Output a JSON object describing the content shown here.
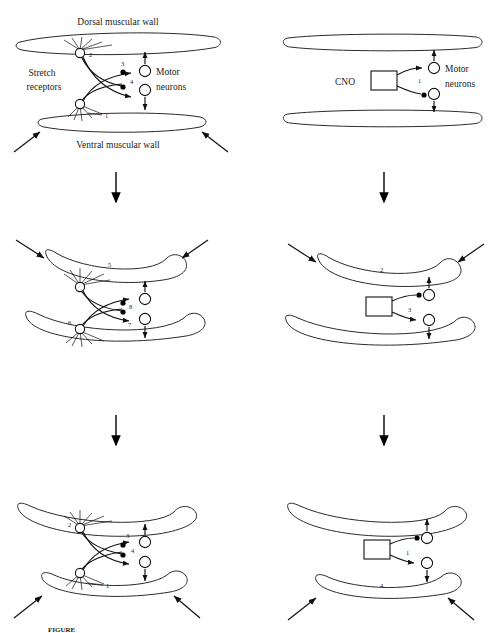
{
  "figure": {
    "caption": "FIGURE",
    "columns": [
      {
        "name": "control",
        "label": ""
      },
      {
        "name": "cno",
        "label": ""
      }
    ],
    "text_labels": {
      "dorsal_wall": "Dorsal muscular wall",
      "ventral_wall": "Ventral muscular wall",
      "stretch_receptors_line1": "Stretch",
      "stretch_receptors_line2": "receptors",
      "motor_neurons_line1": "Motor",
      "motor_neurons_line2": "neurons",
      "cno": "CNO"
    },
    "panels": [
      {
        "id": "top-left",
        "row": 1,
        "column": "control",
        "numbers": [
          "2",
          "3",
          "4",
          "1"
        ],
        "has_stretch_receptors": true,
        "has_cno_box": false,
        "wall_state": "straight",
        "external_arrows": 2
      },
      {
        "id": "top-right",
        "row": 1,
        "column": "cno",
        "numbers": [
          "1"
        ],
        "has_stretch_receptors": false,
        "has_cno_box": true,
        "wall_state": "straight",
        "external_arrows": 0
      },
      {
        "id": "middle-left",
        "row": 2,
        "column": "control",
        "numbers": [
          "5",
          "8",
          "6",
          "7"
        ],
        "has_stretch_receptors": true,
        "has_cno_box": false,
        "wall_state": "bent",
        "external_arrows": 2
      },
      {
        "id": "middle-right",
        "row": 2,
        "column": "cno",
        "numbers": [
          "2",
          "3"
        ],
        "has_stretch_receptors": false,
        "has_cno_box": true,
        "wall_state": "bent",
        "external_arrows": 2
      },
      {
        "id": "bottom-left",
        "row": 3,
        "column": "control",
        "numbers": [
          "2",
          "3",
          "4",
          "1"
        ],
        "has_stretch_receptors": true,
        "has_cno_box": false,
        "wall_state": "bent-down",
        "external_arrows": 2
      },
      {
        "id": "bottom-right",
        "row": 3,
        "column": "cno",
        "numbers": [
          "1",
          "4"
        ],
        "has_stretch_receptors": false,
        "has_cno_box": true,
        "wall_state": "bent-down",
        "external_arrows": 2
      }
    ],
    "flow_arrows": [
      {
        "name": "left-column-step-1-to-2",
        "direction": "down"
      },
      {
        "name": "right-column-step-1-to-2",
        "direction": "down"
      },
      {
        "name": "left-column-step-2-to-3",
        "direction": "down"
      },
      {
        "name": "right-column-step-2-to-3",
        "direction": "down"
      }
    ],
    "colors": {
      "ink": "#1a1a1a",
      "stroke": "#111111",
      "background": "#ffffff"
    }
  }
}
